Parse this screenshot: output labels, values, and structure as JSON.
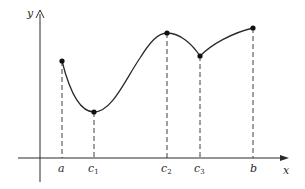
{
  "figure": {
    "axis_labels": {
      "x": "x",
      "y": "y"
    },
    "points": [
      {
        "id": "a",
        "label": "a",
        "subscript": ""
      },
      {
        "id": "c1",
        "label": "c",
        "subscript": "1"
      },
      {
        "id": "c2",
        "label": "c",
        "subscript": "2"
      },
      {
        "id": "c3",
        "label": "c",
        "subscript": "3"
      },
      {
        "id": "b",
        "label": "b",
        "subscript": ""
      }
    ],
    "colors": {
      "ink": "#2a2a2a",
      "background": "#ffffff"
    }
  }
}
